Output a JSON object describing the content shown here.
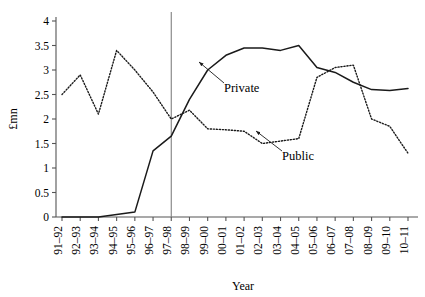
{
  "chart_data": {
    "type": "line",
    "title": "",
    "xlabel": "Year",
    "ylabel": "£mn",
    "ylim": [
      0,
      4
    ],
    "ytick_step": 0.5,
    "grid": false,
    "legend_position": "inline-annotation",
    "categories": [
      "91–92",
      "92–93",
      "93–94",
      "94–95",
      "95–96",
      "96–97",
      "97–98",
      "98–99",
      "99–00",
      "00–01",
      "01–02",
      "02–03",
      "03–04",
      "04–05",
      "05–06",
      "06–07",
      "07–08",
      "08–09",
      "09–10",
      "10–11"
    ],
    "yticks": [
      "0",
      "0.5",
      "1",
      "1.5",
      "2",
      "2.5",
      "3",
      "3.5",
      "4"
    ],
    "series": [
      {
        "name": "Private",
        "style": "solid",
        "color": "#1a1a1a",
        "values": [
          0,
          0,
          0,
          0.05,
          0.1,
          1.35,
          1.65,
          2.4,
          3.0,
          3.3,
          3.45,
          3.45,
          3.4,
          3.5,
          3.05,
          2.95,
          2.75,
          2.6,
          2.58,
          2.62
        ]
      },
      {
        "name": "Public",
        "style": "dotted",
        "color": "#1a1a1a",
        "values": [
          2.5,
          2.9,
          2.1,
          3.4,
          3.0,
          2.55,
          2.0,
          2.18,
          1.8,
          1.78,
          1.75,
          1.5,
          1.55,
          1.6,
          2.85,
          3.05,
          3.1,
          2.0,
          1.85,
          1.3
        ]
      }
    ],
    "annotations": [
      {
        "label": "Private",
        "points_to_series": "Private",
        "points_to_category": "99–00"
      },
      {
        "label": "Public",
        "points_to_series": "Public",
        "points_to_category": "02–03"
      }
    ],
    "reference_line": {
      "category": "97–98",
      "orientation": "vertical",
      "color": "#808080"
    }
  },
  "axis": {
    "ylabel": "£mn",
    "xlabel": "Year"
  },
  "annotation_labels": {
    "private": "Private",
    "public": "Public"
  }
}
